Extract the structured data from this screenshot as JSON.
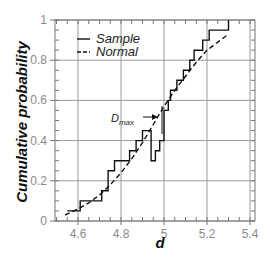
{
  "chart_data": {
    "type": "line",
    "title": "",
    "xlabel": "d",
    "ylabel": "Cumulative probability",
    "xlim": [
      4.5,
      5.4
    ],
    "ylim": [
      0,
      1
    ],
    "x_ticks": [
      4.6,
      4.8,
      5,
      5.2,
      5.4
    ],
    "x_tick_labels": [
      "4.6",
      "4.8",
      "5",
      "5.2",
      "5.4"
    ],
    "y_ticks": [
      0,
      0.2,
      0.4,
      0.6,
      0.8,
      1
    ],
    "y_tick_labels": [
      "0",
      "0.2",
      "0.4",
      "0.6",
      "0.8",
      "1"
    ],
    "grid": true,
    "legend_position": "upper left",
    "series": [
      {
        "name": "Sample",
        "style": "solid step",
        "x": [
          4.55,
          4.61,
          4.61,
          4.71,
          4.71,
          4.74,
          4.74,
          4.77,
          4.77,
          4.84,
          4.84,
          4.87,
          4.87,
          4.9,
          4.9,
          4.94,
          4.94,
          4.96,
          4.96,
          4.98,
          4.98,
          5.0,
          5.0,
          5.02,
          5.02,
          5.03,
          5.03,
          5.06,
          5.06,
          5.09,
          5.09,
          5.12,
          5.12,
          5.14,
          5.14,
          5.18,
          5.18,
          5.21,
          5.21,
          5.3,
          5.3
        ],
        "y": [
          0.05,
          0.05,
          0.1,
          0.1,
          0.15,
          0.15,
          0.25,
          0.25,
          0.3,
          0.3,
          0.35,
          0.35,
          0.4,
          0.4,
          0.45,
          0.45,
          0.3,
          0.3,
          0.35,
          0.35,
          0.4,
          0.4,
          0.55,
          0.55,
          0.6,
          0.6,
          0.65,
          0.65,
          0.7,
          0.7,
          0.75,
          0.75,
          0.8,
          0.8,
          0.85,
          0.85,
          0.9,
          0.9,
          0.95,
          0.95,
          1.0
        ]
      },
      {
        "name": "Normal",
        "style": "dashed",
        "x": [
          4.54,
          4.6,
          4.65,
          4.7,
          4.75,
          4.8,
          4.85,
          4.9,
          4.95,
          5.0,
          5.05,
          5.1,
          5.15,
          5.2,
          5.25,
          5.3
        ],
        "y": [
          0.03,
          0.06,
          0.09,
          0.13,
          0.18,
          0.24,
          0.31,
          0.39,
          0.48,
          0.57,
          0.65,
          0.72,
          0.79,
          0.85,
          0.89,
          0.93
        ]
      }
    ],
    "annotations": [
      {
        "text": "D",
        "subscript": "max",
        "x": 4.84,
        "y": 0.48,
        "arrow_to": [
          4.98,
          0.49
        ]
      }
    ]
  },
  "legend": {
    "items": [
      {
        "label": "Sample",
        "style": "solid"
      },
      {
        "label": "Normal",
        "style": "dashed"
      }
    ]
  },
  "annotation": {
    "main": "D",
    "sub": "max"
  }
}
